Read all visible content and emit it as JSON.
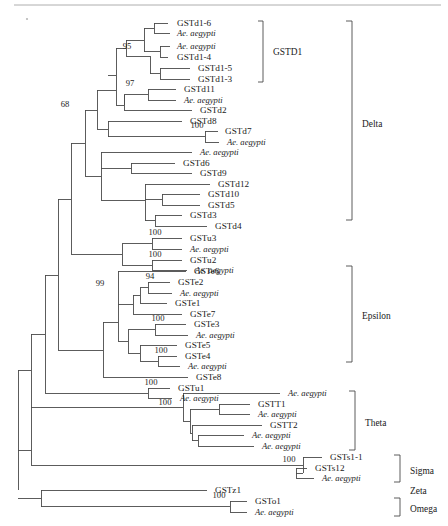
{
  "figure": {
    "type": "phylogenetic-tree",
    "width": 448,
    "height": 526,
    "line_color": "#4a4a4a",
    "text_color": "#1a1a1a",
    "background": "#ffffff"
  },
  "tips": [
    {
      "id": "t1",
      "label": "GSTd1-6",
      "italic": false,
      "y": 23,
      "x": 177
    },
    {
      "id": "t2",
      "label": "Ae. aegypti",
      "italic": true,
      "y": 33,
      "x": 177
    },
    {
      "id": "t3",
      "label": "Ae. aegypti",
      "italic": true,
      "y": 46,
      "x": 177
    },
    {
      "id": "t4",
      "label": "GSTd1-4",
      "italic": false,
      "y": 57,
      "x": 177
    },
    {
      "id": "t5",
      "label": "GSTd1-5",
      "italic": false,
      "y": 68,
      "x": 198
    },
    {
      "id": "t6",
      "label": "GSTd1-3",
      "italic": false,
      "y": 79,
      "x": 198
    },
    {
      "id": "t7",
      "label": "GSTd11",
      "italic": false,
      "y": 89,
      "x": 184
    },
    {
      "id": "t8",
      "label": "Ae. aegypti",
      "italic": true,
      "y": 100,
      "x": 184
    },
    {
      "id": "t9",
      "label": "GSTd2",
      "italic": false,
      "y": 110,
      "x": 200
    },
    {
      "id": "t10",
      "label": "GSTd8",
      "italic": false,
      "y": 121,
      "x": 190
    },
    {
      "id": "t11",
      "label": "GSTd7",
      "italic": false,
      "y": 131,
      "x": 225
    },
    {
      "id": "t12",
      "label": "Ae. aegypti",
      "italic": true,
      "y": 142,
      "x": 227
    },
    {
      "id": "t13",
      "label": "Ae. aegypti",
      "italic": true,
      "y": 152,
      "x": 200
    },
    {
      "id": "t14",
      "label": "GSTd6",
      "italic": false,
      "y": 163,
      "x": 183
    },
    {
      "id": "t15",
      "label": "GSTd9",
      "italic": false,
      "y": 173,
      "x": 200
    },
    {
      "id": "t16",
      "label": "GSTd12",
      "italic": false,
      "y": 184,
      "x": 218
    },
    {
      "id": "t17",
      "label": "GSTd10",
      "italic": false,
      "y": 194,
      "x": 208
    },
    {
      "id": "t18",
      "label": "GSTd5",
      "italic": false,
      "y": 205,
      "x": 208
    },
    {
      "id": "t19",
      "label": "GSTd3",
      "italic": false,
      "y": 215,
      "x": 190
    },
    {
      "id": "t20",
      "label": "GSTd4",
      "italic": false,
      "y": 226,
      "x": 215
    },
    {
      "id": "t21",
      "label": "GSTu3",
      "italic": false,
      "y": 238,
      "x": 190
    },
    {
      "id": "t22",
      "label": "Ae. aegypti",
      "italic": true,
      "y": 249,
      "x": 190
    },
    {
      "id": "t23",
      "label": "GSTu2",
      "italic": false,
      "y": 260,
      "x": 190
    },
    {
      "id": "t24",
      "label": "Ae. aegypti",
      "italic": true,
      "y": 270,
      "x": 195
    },
    {
      "id": "t25",
      "label": "GSTe6",
      "italic": false,
      "y": 271,
      "x": 194
    },
    {
      "id": "t26",
      "label": "GSTe2",
      "italic": false,
      "y": 282,
      "x": 178
    },
    {
      "id": "t27",
      "label": "Ae. aegypti",
      "italic": true,
      "y": 293,
      "x": 180
    },
    {
      "id": "t28",
      "label": "GSTe1",
      "italic": false,
      "y": 303,
      "x": 175
    },
    {
      "id": "t29",
      "label": "GSTe7",
      "italic": false,
      "y": 314,
      "x": 190
    },
    {
      "id": "t30",
      "label": "GSTe3",
      "italic": false,
      "y": 324,
      "x": 194
    },
    {
      "id": "t31",
      "label": "Ae. aegypti",
      "italic": true,
      "y": 335,
      "x": 196
    },
    {
      "id": "t32",
      "label": "GSTe5",
      "italic": false,
      "y": 345,
      "x": 185
    },
    {
      "id": "t33",
      "label": "GSTe4",
      "italic": false,
      "y": 356,
      "x": 185
    },
    {
      "id": "t34",
      "label": "Ae. aegypti",
      "italic": true,
      "y": 366,
      "x": 188
    },
    {
      "id": "t35",
      "label": "GSTe8",
      "italic": false,
      "y": 377,
      "x": 196
    },
    {
      "id": "t36",
      "label": "GSTu1",
      "italic": false,
      "y": 388,
      "x": 178
    },
    {
      "id": "t37",
      "label": "Ae. aegypti",
      "italic": true,
      "y": 398,
      "x": 180
    },
    {
      "id": "t38",
      "label": "Ae. aegypti",
      "italic": true,
      "y": 393,
      "x": 288
    },
    {
      "id": "t39",
      "label": "GSTT1",
      "italic": false,
      "y": 404,
      "x": 258
    },
    {
      "id": "t40",
      "label": "Ae. aegypti",
      "italic": true,
      "y": 414,
      "x": 258
    },
    {
      "id": "t41",
      "label": "GSTT2",
      "italic": false,
      "y": 425,
      "x": 270
    },
    {
      "id": "t42",
      "label": "Ae. aegypti",
      "italic": true,
      "y": 435,
      "x": 252
    },
    {
      "id": "t43",
      "label": "Ae. aegypti",
      "italic": true,
      "y": 446,
      "x": 262
    },
    {
      "id": "t44",
      "label": "GSTs1-1",
      "italic": false,
      "y": 457,
      "x": 330
    },
    {
      "id": "t45",
      "label": "GSTs12",
      "italic": false,
      "y": 468,
      "x": 315
    },
    {
      "id": "t46",
      "label": "Ae. aegypti",
      "italic": true,
      "y": 478,
      "x": 322
    },
    {
      "id": "t47",
      "label": "GSTz1",
      "italic": false,
      "y": 490,
      "x": 215
    },
    {
      "id": "t48",
      "label": "GSTo1",
      "italic": false,
      "y": 501,
      "x": 255
    },
    {
      "id": "t49",
      "label": "Ae. aegypti",
      "italic": true,
      "y": 512,
      "x": 255
    }
  ],
  "branches": [
    {
      "d": "M 168 23 L 154 23 L 154 33 L 170 33"
    },
    {
      "d": "M 154 28 L 144 28 L 144 51.5 L 160 51.5 L 160 46 L 170 46"
    },
    {
      "d": "M 160 51.5 L 160 57 L 168 57"
    },
    {
      "d": "M 144 40 L 126 40"
    },
    {
      "d": "M 190 68 L 160 68 L 160 79 L 190 79"
    },
    {
      "d": "M 160 73.5 L 150 73.5 L 150 56 L 126 56"
    },
    {
      "d": "M 126 40 L 126 56"
    },
    {
      "d": "M 126 48 L 116 48 L 116 75 L 108 75"
    },
    {
      "d": "M 176 89 L 148 89 L 148 100 L 176 100"
    },
    {
      "d": "M 148 94.5 L 138 94.5 L 138 94.5 L 124 94.5"
    },
    {
      "d": "M 124 94.5 L 124 105 L 116 105"
    },
    {
      "d": "M 192 110 L 124 110 L 124 94.5"
    },
    {
      "d": "M 116 75 L 116 105"
    },
    {
      "d": "M 116 90 L 97 90"
    },
    {
      "d": "M 182 121 L 108 121"
    },
    {
      "d": "M 218 131 L 205 131 L 205 142 L 219 142"
    },
    {
      "d": "M 205 136.5 L 108 136.5"
    },
    {
      "d": "M 108 121 L 108 136.5"
    },
    {
      "d": "M 108 129 L 97 129"
    },
    {
      "d": "M 97 90 L 97 129"
    },
    {
      "d": "M 97 110 L 85 110"
    },
    {
      "d": "M 192 152 L 101 152"
    },
    {
      "d": "M 175 163 L 131 163 L 131 173 L 192 173"
    },
    {
      "d": "M 131 168 L 101 168"
    },
    {
      "d": "M 210 184 L 145 184"
    },
    {
      "d": "M 200 194 L 162 194 L 162 205 L 200 205"
    },
    {
      "d": "M 162 199.5 L 145 199.5"
    },
    {
      "d": "M 182 215 L 155 215 L 155 226 L 207 226"
    },
    {
      "d": "M 155 220.5 L 145 220.5"
    },
    {
      "d": "M 145 184 L 145 220.5"
    },
    {
      "d": "M 145 200 L 101 200"
    },
    {
      "d": "M 101 152 L 101 200"
    },
    {
      "d": "M 101 176 L 85 176"
    },
    {
      "d": "M 85 110 L 85 176"
    },
    {
      "d": "M 85 143 L 71 143"
    },
    {
      "d": "M 182 238 L 152 238 L 152 249 L 182 249"
    },
    {
      "d": "M 152 243.5 L 122 243.5"
    },
    {
      "d": "M 182 260 L 152 260 L 152 270 L 187 270"
    },
    {
      "d": "M 152 265 L 122 265"
    },
    {
      "d": "M 122 243.5 L 122 265"
    },
    {
      "d": "M 122 254 L 71 254"
    },
    {
      "d": "M 71 143 L 71 254"
    },
    {
      "d": "M 71 199 L 58 199"
    },
    {
      "d": "M 186 271 L 118 271"
    },
    {
      "d": "M 170 282 L 148 282 L 148 293 L 172 293"
    },
    {
      "d": "M 148 287.5 L 140 287.5"
    },
    {
      "d": "M 167 303 L 140 303"
    },
    {
      "d": "M 140 287.5 L 140 303"
    },
    {
      "d": "M 140 295 L 133 295"
    },
    {
      "d": "M 182 314 L 133 314"
    },
    {
      "d": "M 133 295 L 133 314"
    },
    {
      "d": "M 133 304 L 118 304"
    },
    {
      "d": "M 118 271 L 118 304"
    },
    {
      "d": "M 186 324 L 155 324 L 155 335 L 188 335"
    },
    {
      "d": "M 155 329.5 L 128 329.5"
    },
    {
      "d": "M 177 345 L 140 345"
    },
    {
      "d": "M 177 356 L 158 356 L 158 366 L 180 366"
    },
    {
      "d": "M 158 361 L 140 361"
    },
    {
      "d": "M 140 345 L 140 361"
    },
    {
      "d": "M 140 353 L 128 353"
    },
    {
      "d": "M 128 329.5 L 128 353"
    },
    {
      "d": "M 128 341 L 118 341"
    },
    {
      "d": "M 118 304 L 118 341"
    },
    {
      "d": "M 118 322 L 103 322"
    },
    {
      "d": "M 188 377 L 103 377"
    },
    {
      "d": "M 103 322 L 103 377"
    },
    {
      "d": "M 103 350 L 58 350"
    },
    {
      "d": "M 58 199 L 58 350"
    },
    {
      "d": "M 58 275 L 45 275"
    },
    {
      "d": "M 170 388 L 148 388 L 148 398 L 172 398"
    },
    {
      "d": "M 148 393 L 45 393"
    },
    {
      "d": "M 45 275 L 45 393"
    },
    {
      "d": "M 45 334 L 31 334"
    },
    {
      "d": "M 280 393 L 183 393"
    },
    {
      "d": "M 250 404 L 219 404 L 219 414 L 250 414"
    },
    {
      "d": "M 219 409 L 190 409"
    },
    {
      "d": "M 262 425 L 192 425"
    },
    {
      "d": "M 244 435 L 198 435 L 198 446 L 254 446"
    },
    {
      "d": "M 198 440.5 L 192 440.5"
    },
    {
      "d": "M 192 425 L 192 440.5"
    },
    {
      "d": "M 192 433 L 190 433"
    },
    {
      "d": "M 190 409 L 190 433"
    },
    {
      "d": "M 190 421 L 183 421"
    },
    {
      "d": "M 183 393 L 183 421"
    },
    {
      "d": "M 183 407 L 31 407"
    },
    {
      "d": "M 31 334 L 31 407"
    },
    {
      "d": "M 31 370 L 18 370"
    },
    {
      "d": "M 322 457 L 303 457"
    },
    {
      "d": "M 307 468 L 296 468 L 296 478 L 314 478"
    },
    {
      "d": "M 296 473 L 303 473"
    },
    {
      "d": "M 303 457 L 303 473"
    },
    {
      "d": "M 303 465 L 31 465"
    },
    {
      "d": "M 31 407 L 31 465"
    },
    {
      "d": "M 18 370 L 18 436"
    },
    {
      "d": "M 18 436 L 18 490"
    },
    {
      "d": "M 207 490 L 41 490"
    },
    {
      "d": "M 247 501 L 230 501 L 230 512 L 247 512"
    },
    {
      "d": "M 230 506.5 L 41 506.5"
    },
    {
      "d": "M 41 490 L 41 506.5"
    },
    {
      "d": "M 41 498 L 18 498"
    },
    {
      "d": "M 18 450 L 31 450"
    }
  ],
  "support_values": [
    {
      "value": "95",
      "x": 127,
      "y": 49
    },
    {
      "value": "97",
      "x": 130,
      "y": 86
    },
    {
      "value": "68",
      "x": 65,
      "y": 107
    },
    {
      "value": "100",
      "x": 197,
      "y": 128
    },
    {
      "value": "100",
      "x": 155,
      "y": 235
    },
    {
      "value": "100",
      "x": 155,
      "y": 257
    },
    {
      "value": "99",
      "x": 100,
      "y": 286
    },
    {
      "value": "94",
      "x": 150,
      "y": 279
    },
    {
      "value": "100",
      "x": 158,
      "y": 321
    },
    {
      "value": "100",
      "x": 161,
      "y": 353
    },
    {
      "value": "100",
      "x": 151,
      "y": 385
    },
    {
      "value": "100",
      "x": 165,
      "y": 405
    },
    {
      "value": "100",
      "x": 289,
      "y": 462
    },
    {
      "value": "100",
      "x": 219,
      "y": 498
    }
  ],
  "clade_brackets": [
    {
      "name": "GSTD1",
      "label": "GSTD1",
      "x": 263,
      "y_top": 21,
      "y_bottom": 82,
      "tick": 5,
      "label_x": 273,
      "label_y": 52
    },
    {
      "name": "Delta",
      "label": "Delta",
      "x": 352,
      "y_top": 21,
      "y_bottom": 220,
      "tick": 6,
      "label_x": 362,
      "label_y": 124
    },
    {
      "name": "Epsilon",
      "label": "Epsilon",
      "x": 352,
      "y_top": 266,
      "y_bottom": 362,
      "tick": 6,
      "label_x": 362,
      "label_y": 316
    },
    {
      "name": "Theta",
      "label": "Theta",
      "x": 355,
      "y_top": 391,
      "y_bottom": 450,
      "tick": 6,
      "label_x": 365,
      "label_y": 423
    },
    {
      "name": "Sigma",
      "label": "Sigma",
      "x": 400,
      "y_top": 455,
      "y_bottom": 482,
      "tick": 6,
      "label_x": 410,
      "label_y": 471
    },
    {
      "name": "Omega",
      "label": "Omega",
      "x": 400,
      "y_top": 498,
      "y_bottom": 516,
      "tick": 6,
      "label_x": 410,
      "label_y": 509
    }
  ],
  "standalone_clade_labels": [
    {
      "name": "Zeta",
      "label": "Zeta",
      "x": 410,
      "y": 491
    }
  ],
  "decorations": {
    "top_rule": {
      "x1": 14,
      "y1": 5,
      "x2": 441,
      "y2": 5,
      "color": "#9a9a9a"
    },
    "speck": {
      "x": 27,
      "y": 19,
      "r": 1.1
    }
  }
}
